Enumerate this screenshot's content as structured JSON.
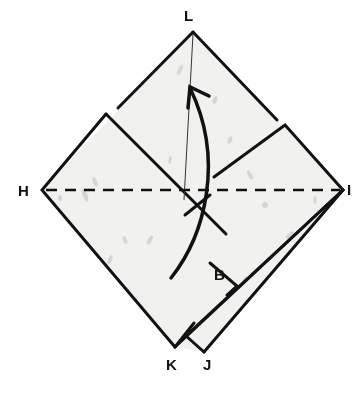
{
  "diagram": {
    "type": "origami-fold-step",
    "colors": {
      "paper": "#f1f1ef",
      "line": "#111111",
      "speckle": "#c8c8c8",
      "background": "#ffffff"
    },
    "labels": {
      "L": "L",
      "H": "H",
      "I": "I",
      "K": "K",
      "J": "J",
      "B": "B"
    },
    "fold_line": {
      "style": "dashed",
      "from": "H",
      "to": "I"
    },
    "arrow": {
      "style": "curved",
      "direction": "up",
      "target": "L"
    }
  }
}
